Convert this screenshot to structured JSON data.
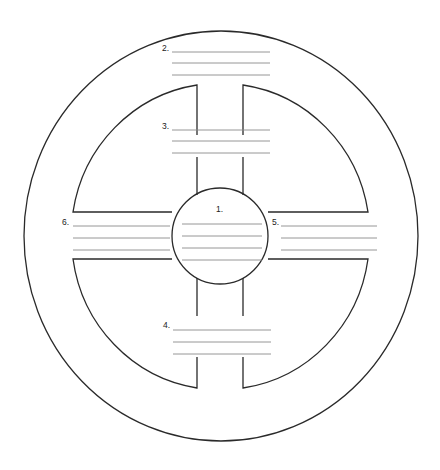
{
  "diagram": {
    "type": "medicine-wheel-worksheet",
    "colors": {
      "outline": "#2a2a2a",
      "write_line": "#8a8a8a",
      "background": "#ffffff"
    },
    "sections": [
      {
        "id": "center",
        "label": "1.",
        "lines": 4
      },
      {
        "id": "outer-top",
        "label": "2.",
        "lines": 3
      },
      {
        "id": "inner-top",
        "label": "3.",
        "lines": 3
      },
      {
        "id": "inner-bottom",
        "label": "4.",
        "lines": 3
      },
      {
        "id": "right-arm",
        "label": "5.",
        "lines": 3
      },
      {
        "id": "left-arm",
        "label": "6.",
        "lines": 3
      }
    ]
  }
}
